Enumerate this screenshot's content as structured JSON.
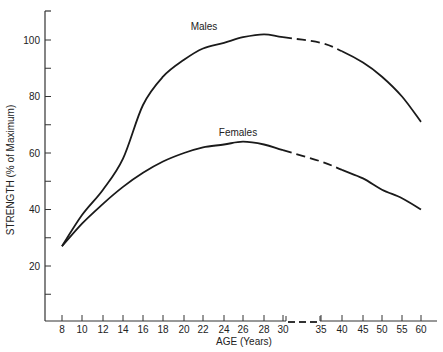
{
  "chart_data": {
    "type": "line",
    "title": "",
    "xlabel": "AGE (Years)",
    "ylabel": "STRENGTH (% of Maximum)",
    "ylim": [
      0,
      110
    ],
    "yticks": [
      20,
      40,
      60,
      80,
      100
    ],
    "yticks_minor": [
      10,
      30,
      50,
      70,
      90
    ],
    "xtick_labels": [
      "8",
      "10",
      "12",
      "14",
      "16",
      "18",
      "20",
      "22",
      "24",
      "26",
      "28",
      "30",
      "35",
      "40",
      "45",
      "50",
      "55",
      "60"
    ],
    "axis_break": "between 30 and 35",
    "grid": false,
    "legend": "inline labels",
    "series": [
      {
        "name": "Males",
        "x": [
          8,
          10,
          12,
          14,
          16,
          18,
          20,
          22,
          24,
          26,
          28,
          30,
          35,
          40,
          45,
          50,
          55,
          60
        ],
        "values": [
          27,
          38,
          47,
          58,
          77,
          87,
          93,
          97,
          99,
          101,
          102,
          101,
          99,
          96,
          92,
          87,
          80,
          71
        ],
        "dashed_range": [
          30,
          40
        ]
      },
      {
        "name": "Females",
        "x": [
          8,
          10,
          12,
          14,
          16,
          18,
          20,
          22,
          24,
          26,
          28,
          30,
          35,
          40,
          45,
          50,
          55,
          60
        ],
        "values": [
          27,
          35,
          42,
          48,
          53,
          57,
          60,
          62,
          63,
          64,
          63,
          61,
          57,
          54,
          51,
          47,
          44,
          40
        ],
        "dashed_range": [
          30,
          40
        ]
      }
    ]
  },
  "labels": {
    "males": "Males",
    "females": "Females",
    "xlabel": "AGE (Years)",
    "ylabel": "STRENGTH (% of Maximum)"
  }
}
